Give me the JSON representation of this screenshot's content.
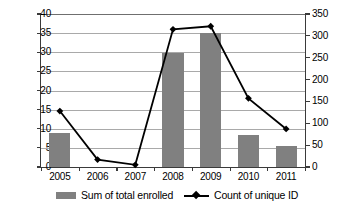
{
  "chart_data": {
    "type": "bar",
    "title": "",
    "xlabel": "",
    "ylabel": "",
    "grid": true,
    "legend_position": "bottom",
    "categories": [
      "2005",
      "2006",
      "2007",
      "2008",
      "2009",
      "2010",
      "2011"
    ],
    "series": [
      {
        "name": "Sum of total enrolled",
        "type": "bar",
        "axis": "left",
        "color": "#808080",
        "values": [
          9,
          0,
          0,
          29.7,
          35,
          8.3,
          5.5
        ]
      },
      {
        "name": "Count of unique ID",
        "type": "line",
        "axis": "right",
        "color": "#000000",
        "marker": "diamond",
        "values": [
          128,
          17,
          5,
          315,
          322,
          157,
          87
        ]
      }
    ],
    "left_axis": {
      "min": 0,
      "max": 40,
      "step": 5,
      "ticks": [
        "0",
        "5",
        "10",
        "15",
        "20",
        "25",
        "30",
        "35",
        "40"
      ]
    },
    "right_axis": {
      "min": 0,
      "max": 350,
      "step": 50,
      "ticks": [
        "0",
        "50",
        "100",
        "150",
        "200",
        "250",
        "300",
        "350"
      ]
    }
  },
  "legend": {
    "items": [
      {
        "label": "Sum of total enrolled",
        "marker": "bar-swatch"
      },
      {
        "label": "Count of unique ID",
        "marker": "line-diamond-swatch"
      }
    ]
  }
}
